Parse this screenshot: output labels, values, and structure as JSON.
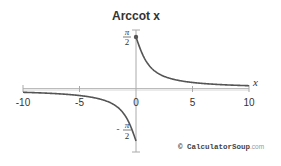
{
  "chart_data": {
    "type": "line",
    "title": "Arccot x",
    "xlabel": "x",
    "ylabel": "",
    "xlim": [
      -10,
      10
    ],
    "ylim": [
      -1.5708,
      1.5708
    ],
    "x_ticks": [
      -10,
      -5,
      0,
      5,
      10
    ],
    "x_tick_labels": [
      "-10",
      "-5",
      "0",
      "5",
      "10"
    ],
    "y_ticks": [
      1.5708,
      -1.5708
    ],
    "y_tick_labels": [
      "π/2",
      "−π/2"
    ],
    "grid": false,
    "legend": null,
    "series": [
      {
        "name": "arccot x (x < 0 branch)",
        "x": [
          -10,
          -8,
          -6,
          -5,
          -4,
          -3,
          -2,
          -1.5,
          -1,
          -0.75,
          -0.5,
          -0.25,
          -0.1,
          0
        ],
        "values": [
          -0.0997,
          -0.1244,
          -0.1651,
          -0.1974,
          -0.245,
          -0.3218,
          -0.4636,
          -0.588,
          -0.7854,
          -0.9273,
          -1.1071,
          -1.3258,
          -1.4711,
          -1.5708
        ],
        "endpoint": "open"
      },
      {
        "name": "arccot x (x ≥ 0 branch)",
        "x": [
          0,
          0.1,
          0.25,
          0.5,
          0.75,
          1,
          1.5,
          2,
          3,
          4,
          5,
          6,
          8,
          10
        ],
        "values": [
          1.5708,
          1.4711,
          1.3258,
          1.1071,
          0.9273,
          0.7854,
          0.588,
          0.4636,
          0.3218,
          0.245,
          0.1974,
          0.1651,
          0.1244,
          0.0997
        ],
        "endpoint": "closed"
      }
    ],
    "annotations": [
      {
        "type": "point",
        "x": 0,
        "y": 1.5708,
        "style": "filled"
      }
    ]
  },
  "labels": {
    "title": "Arccot x",
    "x_axis": "x",
    "ticks": [
      "-10",
      "-5",
      "0",
      "5",
      "10"
    ],
    "pi_num": "π",
    "pi_den": "2",
    "neg_sign": "-"
  },
  "watermark": {
    "symbol": "©",
    "brand": "CalculatorSoup",
    "suffix": ".com"
  },
  "colors": {
    "curve": "#555555",
    "axis": "#aaaaaa",
    "text": "#333333"
  }
}
